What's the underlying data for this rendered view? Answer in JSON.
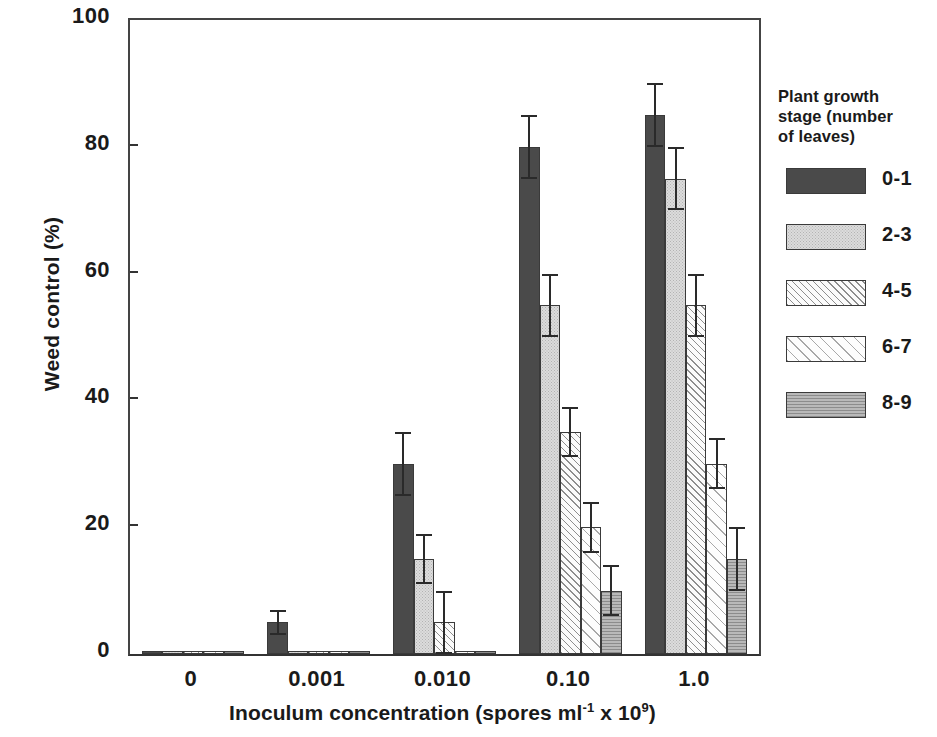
{
  "chart_data": {
    "type": "bar",
    "title": "",
    "xlabel": "Inoculum concentration (spores ml-1 x 109)",
    "xlabel_parts": {
      "prefix": "Inoculum concentration (spores ml",
      "sup1": "-1",
      "middle": " x 10",
      "sup2": "9",
      "suffix": ")"
    },
    "ylabel": "Weed control (%)",
    "categories": [
      "0",
      "0.001",
      "0.010",
      "0.10",
      "1.0"
    ],
    "ylim": [
      0,
      100
    ],
    "yticks": [
      0,
      20,
      40,
      60,
      80,
      100
    ],
    "ytick_labels": [
      "0",
      "20",
      "40",
      "60",
      "80",
      "100"
    ],
    "grid": false,
    "legend_position": "right",
    "legend_title": "Plant growth stage (number of leaves)",
    "series": [
      {
        "name": "0-1",
        "color": "#4a4a4a",
        "pattern": "solid-dark",
        "values": [
          0.5,
          5,
          30,
          80,
          85
        ],
        "errors": [
          0.3,
          2,
          5,
          5,
          5
        ]
      },
      {
        "name": "2-3",
        "color": "#dcdcdc",
        "pattern": "fine-stipple",
        "values": [
          0.5,
          0.5,
          15,
          55,
          75
        ],
        "errors": [
          0.3,
          0.3,
          4,
          5,
          5
        ]
      },
      {
        "name": "4-5",
        "color": "#fbfbfb",
        "pattern": "diagonal-hatch",
        "values": [
          0.5,
          0.5,
          5,
          35,
          55
        ],
        "errors": [
          0.3,
          0.3,
          5,
          4,
          5
        ]
      },
      {
        "name": "6-7",
        "color": "#fdfdfd",
        "pattern": "wide-diagonal-hatch",
        "values": [
          0.5,
          0.5,
          0.5,
          20,
          30
        ],
        "errors": [
          0.3,
          0.3,
          0.3,
          4,
          4
        ]
      },
      {
        "name": "8-9",
        "color": "#b9b9b9",
        "pattern": "horizontal-line-gray",
        "values": [
          0.5,
          0.5,
          0.5,
          10,
          15
        ],
        "errors": [
          0.3,
          0.3,
          0.3,
          4,
          5
        ]
      }
    ]
  },
  "legend": {
    "title": "Plant growth\nstage (number\nof leaves)",
    "entries": [
      {
        "label": "0-1"
      },
      {
        "label": "2-3"
      },
      {
        "label": "4-5"
      },
      {
        "label": "6-7"
      },
      {
        "label": "8-9"
      }
    ]
  }
}
